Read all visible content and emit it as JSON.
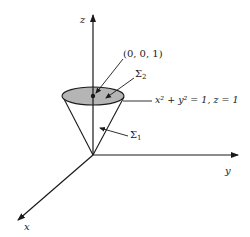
{
  "figure": {
    "type": "3d-axes-cone-diagram",
    "colors": {
      "stroke": "#1a1a1a",
      "disk_fill": "#b5b5b5",
      "background": "#ffffff"
    },
    "axes": {
      "z_label": "z",
      "y_label": "y",
      "x_label": "x"
    },
    "annotations": {
      "point_label": "(0, 0, 1)",
      "sigma2_base": "Σ",
      "sigma2_sub": "2",
      "sigma1_base": "Σ",
      "sigma1_sub": "1",
      "boundary_eq": "x² + y² = 1, z = 1"
    }
  }
}
